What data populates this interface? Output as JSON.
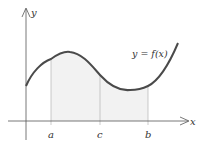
{
  "diagram": {
    "axes": {
      "x_label": "x",
      "y_label": "y"
    },
    "curve_label": "y = f(x)",
    "ticks": [
      {
        "label": "a",
        "x": 51
      },
      {
        "label": "c",
        "x": 100
      },
      {
        "label": "b",
        "x": 148
      }
    ],
    "colors": {
      "curve": "#4a4a4a",
      "fill": "#f2f2f2",
      "axis": "#555555"
    }
  }
}
